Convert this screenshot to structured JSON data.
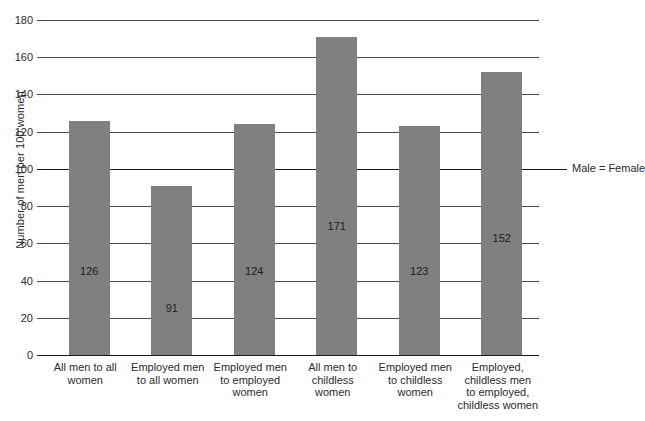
{
  "chart_data": {
    "type": "bar",
    "title": "",
    "xlabel": "",
    "ylabel": "Number of men per 100 women",
    "ylim": [
      0,
      180
    ],
    "ytick_step": 20,
    "yticks": [
      0,
      20,
      40,
      60,
      80,
      100,
      120,
      140,
      160,
      180
    ],
    "ytick_labels": [
      "0",
      "20",
      "40",
      "60",
      "80",
      "100",
      "120",
      "140",
      "160",
      "180"
    ],
    "grid": true,
    "legend": "none",
    "bar_color": "#808080",
    "categories": [
      "All men to all women",
      "Employed men to all women",
      "Employed men to employed women",
      "All men to childless women",
      "Employed men to childless women",
      "Employed, childless men to employed, childless women"
    ],
    "category_lines": [
      [
        "All men to all",
        "women"
      ],
      [
        "Employed men",
        "to all women"
      ],
      [
        "Employed men",
        "to employed",
        "women"
      ],
      [
        "All men to",
        "childless",
        "women"
      ],
      [
        "Employed men",
        "to childless",
        "women"
      ],
      [
        "Employed,",
        "childless men",
        "to employed,",
        "childless women"
      ]
    ],
    "values": [
      126,
      91,
      124,
      171,
      123,
      152
    ],
    "value_labels": [
      "126",
      "91",
      "124",
      "171",
      "123",
      "152"
    ],
    "annotations": [
      {
        "text": "Male = Female",
        "value": 100
      }
    ]
  }
}
